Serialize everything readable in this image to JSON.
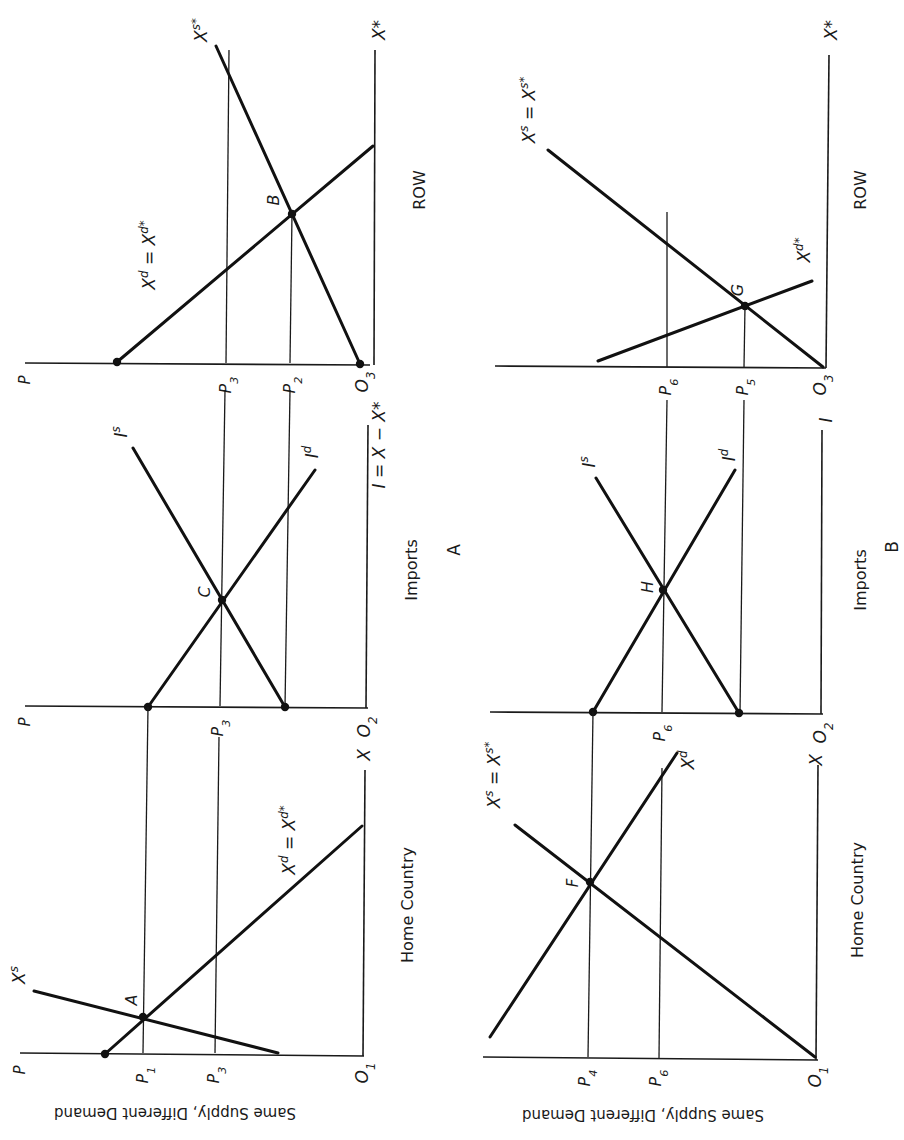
{
  "figure": {
    "orientation": "rotated 90 degrees counter-clockwise (price axis horizontal)",
    "panels": [
      {
        "id": "A",
        "label": "A",
        "row_label": "Same Supply, Different Demand",
        "subpanels": [
          {
            "id": "home",
            "title": "Home Country",
            "price_axis": "P",
            "origin": "O",
            "origin_sub": "1",
            "quantity_axis": "X",
            "price_ticks": [
              {
                "base": "P",
                "sub": "1"
              },
              {
                "base": "P",
                "sub": "3"
              }
            ],
            "curves": [
              {
                "name": "X",
                "sup": "s",
                "suffix": "",
                "role": "supply"
              },
              {
                "name": "X",
                "sup": "d",
                "suffix": " = X",
                "sup2": "d*",
                "role": "demand"
              }
            ],
            "points": [
              {
                "label": "A"
              }
            ]
          },
          {
            "id": "imports",
            "title": "Imports",
            "price_axis": "P",
            "origin": "O",
            "origin_sub": "2",
            "quantity_axis": "I = X − X*",
            "price_ticks": [
              {
                "base": "P",
                "sub": "3"
              }
            ],
            "curves": [
              {
                "name": "I",
                "sup": "s",
                "role": "import supply"
              },
              {
                "name": "I",
                "sup": "d",
                "role": "import demand"
              }
            ],
            "points": [
              {
                "label": "C"
              }
            ]
          },
          {
            "id": "row",
            "title": "ROW",
            "price_axis": "P",
            "origin": "O",
            "origin_sub": "3",
            "quantity_axis": "X*",
            "price_ticks": [
              {
                "base": "P",
                "sub": "3"
              },
              {
                "base": "P",
                "sub": "2"
              }
            ],
            "curves": [
              {
                "name": "X",
                "sup": "s*",
                "role": "supply"
              },
              {
                "name": "X",
                "sup": "d",
                "suffix": " = X",
                "sup2": "d*",
                "role": "demand"
              }
            ],
            "points": [
              {
                "label": "B"
              }
            ]
          }
        ]
      },
      {
        "id": "B",
        "label": "B",
        "row_label": "Same Supply, Different Demand",
        "subpanels": [
          {
            "id": "home",
            "title": "Home Country",
            "price_axis": "",
            "origin": "O",
            "origin_sub": "1",
            "quantity_axis": "X",
            "price_ticks": [
              {
                "base": "P",
                "sub": "4"
              },
              {
                "base": "P",
                "sub": "6"
              }
            ],
            "curves": [
              {
                "name": "X",
                "sup": "s",
                "suffix": " = X",
                "sup2": "s*",
                "role": "supply"
              },
              {
                "name": "X",
                "sup": "d",
                "role": "demand"
              }
            ],
            "points": [
              {
                "label": "F"
              }
            ]
          },
          {
            "id": "imports",
            "title": "Imports",
            "price_axis": "",
            "origin": "O",
            "origin_sub": "2",
            "quantity_axis": "I",
            "price_ticks": [
              {
                "base": "P",
                "sub": "6"
              }
            ],
            "curves": [
              {
                "name": "I",
                "sup": "s",
                "role": "import supply"
              },
              {
                "name": "I",
                "sup": "d",
                "role": "import demand"
              }
            ],
            "points": [
              {
                "label": "H"
              }
            ]
          },
          {
            "id": "row",
            "title": "ROW",
            "price_axis": "",
            "origin": "O",
            "origin_sub": "3",
            "quantity_axis": "X*",
            "price_ticks": [
              {
                "base": "P",
                "sub": "6"
              },
              {
                "base": "P",
                "sub": "5"
              }
            ],
            "curves": [
              {
                "name": "X",
                "sup": "s",
                "suffix": " = X",
                "sup2": "s*",
                "role": "supply"
              },
              {
                "name": "X",
                "sup": "d*",
                "role": "demand"
              }
            ],
            "points": [
              {
                "label": "G"
              }
            ]
          }
        ]
      }
    ]
  },
  "text": {
    "caption_A": "Same Supply, Different Demand",
    "caption_B": "Same Supply, Different Demand",
    "panel_A": "A",
    "panel_B": "B",
    "home": "Home Country",
    "imports": "Imports",
    "row": "ROW",
    "P": "P",
    "O": "O",
    "X": "X",
    "Xstar": "X*",
    "I": "I",
    "I_eq": "I = X − X*",
    "pt_A": "A",
    "pt_B": "B",
    "pt_C": "C",
    "pt_F": "F",
    "pt_G": "G",
    "pt_H": "H"
  }
}
